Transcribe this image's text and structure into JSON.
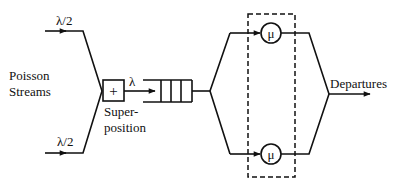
{
  "diagram": {
    "type": "queueing-system",
    "labels": {
      "input_top_rate": "λ/2",
      "input_bottom_rate": "λ/2",
      "sources_line1": "Poisson",
      "sources_line2": "Streams",
      "superposition_symbol": "+",
      "superposition_line1": "Super-",
      "superposition_line2": "position",
      "merged_rate": "λ",
      "server_top_rate": "μ",
      "server_bottom_rate": "μ",
      "output": "Departures"
    },
    "nodes": [
      {
        "id": "input-top",
        "label": "λ/2"
      },
      {
        "id": "input-bottom",
        "label": "λ/2"
      },
      {
        "id": "superposition",
        "label": "+"
      },
      {
        "id": "queue",
        "slots": 3
      },
      {
        "id": "server-top",
        "label": "μ"
      },
      {
        "id": "server-bottom",
        "label": "μ"
      },
      {
        "id": "departures",
        "label": "Departures"
      }
    ],
    "edges": [
      [
        "input-top",
        "superposition"
      ],
      [
        "input-bottom",
        "superposition"
      ],
      [
        "superposition",
        "queue"
      ],
      [
        "queue",
        "server-top"
      ],
      [
        "queue",
        "server-bottom"
      ],
      [
        "server-top",
        "departures"
      ],
      [
        "server-bottom",
        "departures"
      ]
    ],
    "group": {
      "name": "servers",
      "style": "dashed",
      "members": [
        "server-top",
        "server-bottom"
      ]
    }
  }
}
